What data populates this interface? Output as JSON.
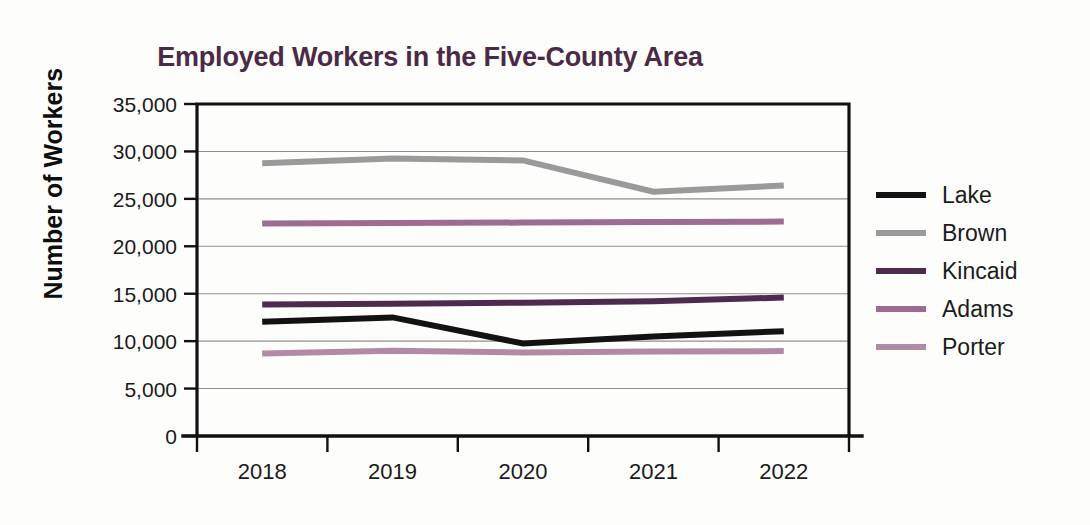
{
  "chart_data": {
    "type": "line",
    "title": "Employed Workers in the Five-County Area",
    "xlabel": "",
    "ylabel": "Number of Workers",
    "categories": [
      "2018",
      "2019",
      "2020",
      "2021",
      "2022"
    ],
    "ylim": [
      0,
      35000
    ],
    "ytick_labels": [
      "35,000",
      "30,000",
      "25,000",
      "20,000",
      "15,000",
      "10,000",
      "5,000",
      "0"
    ],
    "ytick_values": [
      35000,
      30000,
      25000,
      20000,
      15000,
      10000,
      5000,
      0
    ],
    "grid": "horizontal",
    "legend_position": "right",
    "series": [
      {
        "name": "Lake",
        "color": "#121212",
        "values": [
          12050,
          12500,
          9750,
          10500,
          11050
        ]
      },
      {
        "name": "Brown",
        "color": "#9a9a9a",
        "values": [
          28750,
          29250,
          29050,
          25750,
          26400
        ]
      },
      {
        "name": "Kincaid",
        "color": "#4c2b4e",
        "values": [
          13850,
          13950,
          14050,
          14200,
          14600
        ]
      },
      {
        "name": "Adams",
        "color": "#9c6d90",
        "values": [
          22400,
          22450,
          22500,
          22550,
          22600
        ]
      },
      {
        "name": "Porter",
        "color": "#b08ba3",
        "values": [
          8700,
          9000,
          8800,
          8900,
          8950
        ]
      }
    ]
  },
  "title": {
    "text": "Employed Workers in the Five-County Area",
    "color": "#4a2a46"
  },
  "axes": {
    "y_title": "Number of Workers",
    "y_ticks": [
      "35,000",
      "30,000",
      "25,000",
      "20,000",
      "15,000",
      "10,000",
      "5,000",
      "0"
    ],
    "x_ticks": [
      "2018",
      "2019",
      "2020",
      "2021",
      "2022"
    ]
  },
  "legend": {
    "items": [
      {
        "label": "Lake",
        "color": "#121212"
      },
      {
        "label": "Brown",
        "color": "#9a9a9a"
      },
      {
        "label": "Kincaid",
        "color": "#4c2b4e"
      },
      {
        "label": "Adams",
        "color": "#9c6d90"
      },
      {
        "label": "Porter",
        "color": "#b08ba3"
      }
    ]
  }
}
